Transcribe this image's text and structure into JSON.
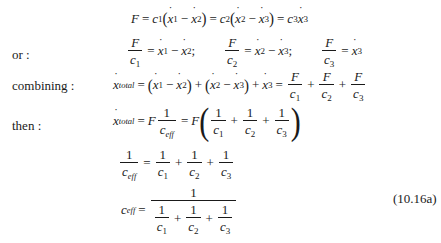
{
  "labels": {
    "or": "or :",
    "combining": "combining :",
    "then": "then :"
  },
  "symbols": {
    "F": "F",
    "c": "c",
    "x": "x",
    "one": "1",
    "eq": "=",
    "minus": "−",
    "plus": "+",
    "semicolon": ";",
    "lparen": "(",
    "rparen": ")",
    "sub1": "1",
    "sub2": "2",
    "sub3": "3",
    "total": "total",
    "eff": "eff"
  },
  "equations": [
    {
      "id": "force-balance",
      "text": "F = c1(ẋ1 − ẋ2) = c2(ẋ2 − ẋ3) = c3ẋ3"
    },
    {
      "id": "or-relations",
      "text": "F/c1 = ẋ1 − ẋ2;  F/c2 = ẋ2 − ẋ3;  F/c3 = ẋ3"
    },
    {
      "id": "combining",
      "text": "ẋtotal = (ẋ1 − ẋ2) + (ẋ2 − ẋ3) + ẋ3 = F/c1 + F/c2 + F/c3"
    },
    {
      "id": "then",
      "text": "ẋtotal = F·1/ceff = F(1/c1 + 1/c2 + 1/c3)"
    },
    {
      "id": "reciprocal",
      "text": "1/ceff = 1/c1 + 1/c2 + 1/c3"
    },
    {
      "id": "ceff",
      "text": "ceff = 1 / (1/c1 + 1/c2 + 1/c3)"
    }
  ],
  "equation_number": "(10.16a)"
}
